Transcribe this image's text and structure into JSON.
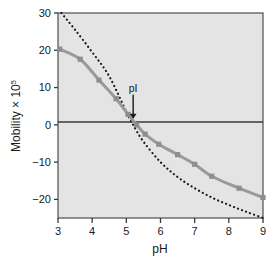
{
  "chart_data": {
    "type": "line",
    "title": "",
    "xlabel": "pH",
    "ylabel": "Mobility × 10",
    "ylabel_exponent": "5",
    "xlim": [
      3,
      9
    ],
    "ylim": [
      -25,
      30
    ],
    "xticks": [
      "3",
      "4",
      "5",
      "6",
      "7",
      "8",
      "9"
    ],
    "xtick_values": [
      3,
      4,
      5,
      6,
      7,
      8,
      9
    ],
    "yticks": [
      "30",
      "20",
      "10",
      "0",
      "−10",
      "−20"
    ],
    "ytick_values": [
      30,
      20,
      10,
      0,
      -10,
      -20
    ],
    "grid": false,
    "legend": "none",
    "zero_line": 0,
    "background_color": "#e4e4e4",
    "frame_color": "#5a5a5a",
    "series": [
      {
        "name": "Observed mobility",
        "style": "solid",
        "color": "#9a9a9a",
        "marker": "square",
        "marker_color": "#8e8e8e",
        "x": [
          3.05,
          3.65,
          4.2,
          4.7,
          5.05,
          5.3,
          5.55,
          5.95,
          6.5,
          7.0,
          7.5,
          8.3,
          9.0
        ],
        "y": [
          20.3,
          17.6,
          12.0,
          7.0,
          2.8,
          0.0,
          -2.5,
          -5.2,
          -8.0,
          -10.6,
          -13.8,
          -17.0,
          -19.5
        ]
      },
      {
        "name": "Theoretical mobility",
        "style": "dotted",
        "color": "#1a1a1a",
        "marker": "none",
        "x": [
          3.1,
          3.5,
          4.0,
          4.5,
          5.0,
          5.2,
          5.5,
          6.0,
          6.5,
          7.0,
          7.5,
          8.0,
          8.5,
          9.0
        ],
        "y": [
          30.0,
          25.5,
          19.5,
          13.0,
          3.5,
          0.0,
          -4.5,
          -10.0,
          -14.0,
          -17.0,
          -19.5,
          -21.5,
          -23.3,
          -25.0
        ]
      }
    ],
    "annotations": [
      {
        "name": "isoelectric-point",
        "label": "pI",
        "x": 5.2,
        "y": 0,
        "arrow": "down"
      }
    ]
  }
}
